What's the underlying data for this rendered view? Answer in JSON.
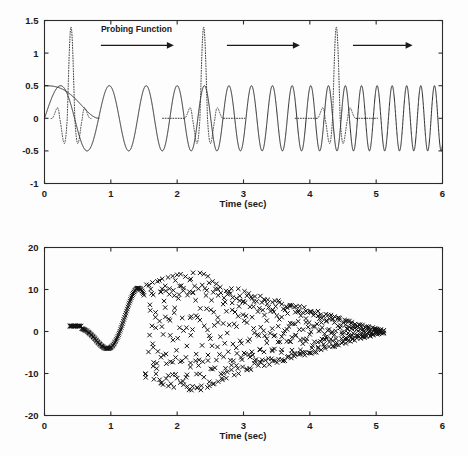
{
  "figure": {
    "name": "probing-function-chirp-figure",
    "panel_count": 2
  },
  "chart_data": [
    {
      "type": "line",
      "id": "top-panel",
      "title": "",
      "xlabel": "Time (sec)",
      "ylabel": "",
      "xlim": [
        0,
        6
      ],
      "ylim": [
        -1,
        1.5
      ],
      "xticks": [
        0,
        1,
        2,
        3,
        4,
        5,
        6
      ],
      "xtick_labels": [
        "0",
        "1",
        "2",
        "3",
        "4",
        "5",
        "6"
      ],
      "yticks": [
        -1,
        -0.5,
        0,
        0.5,
        1,
        1.5
      ],
      "ytick_labels": [
        "-1",
        "-0.5",
        "0",
        "0.5",
        "1",
        "1.5"
      ],
      "grid": false,
      "legend": "none",
      "annotations": [
        {
          "text": "Probing Function",
          "x": 0.85,
          "y": 1.32
        }
      ],
      "arrows": [
        {
          "x_start": 0.85,
          "x_end": 1.95,
          "y": 1.12
        },
        {
          "x_start": 2.75,
          "x_end": 3.85,
          "y": 1.12
        },
        {
          "x_start": 4.65,
          "x_end": 5.55,
          "y": 1.12
        }
      ],
      "series": [
        {
          "name": "chirp signal",
          "style": "solid",
          "amplitude": 0.5,
          "description": "Linear chirp, constant amplitude 0.5, frequency increasing from about 1 Hz at t=0 to about 5 Hz at t=6",
          "freq_start_hz": 0.95,
          "freq_end_hz": 5.0
        },
        {
          "name": "probing function envelope",
          "style": "solid",
          "description": "Decaying probe envelope starting at 0.5 at t=0, flattening to 0 by t approximately 0.8",
          "y_start": 0.5,
          "y_end": 0.0,
          "x_start": 0.0,
          "x_end": 0.82
        },
        {
          "name": "probe burst 1",
          "style": "dotted",
          "center_x": 0.4,
          "peak": 1.4,
          "trough": -0.65
        },
        {
          "name": "probe burst 2",
          "style": "dotted",
          "center_x": 2.4,
          "peak": 1.4,
          "trough": -0.65
        },
        {
          "name": "probe burst 3",
          "style": "dotted",
          "center_x": 4.4,
          "peak": 1.4,
          "trough": -0.65
        }
      ]
    },
    {
      "type": "scatter",
      "id": "bottom-panel",
      "title": "",
      "xlabel": "Time (sec)",
      "ylabel": "",
      "xlim": [
        0,
        6
      ],
      "ylim": [
        -20,
        20
      ],
      "xticks": [
        0,
        1,
        2,
        3,
        4,
        5,
        6
      ],
      "xtick_labels": [
        "0",
        "1",
        "2",
        "3",
        "4",
        "5",
        "6"
      ],
      "yticks": [
        -20,
        -10,
        0,
        10,
        20
      ],
      "ytick_labels": [
        "-20",
        "-10",
        "0",
        "10",
        "20"
      ],
      "grid": false,
      "legend": "none",
      "marker": "x",
      "series": [
        {
          "name": "correlation output",
          "style": "scatter-x",
          "description": "Dense x-markers tracing a smooth damped curve from t=0.4 to t=1.45, then dispersing into a widening scatter cloud peaking near plus or minus 14 around t=2.3 and decaying toward 0 by t=5.1",
          "x_start": 0.38,
          "x_end": 5.1,
          "envelope_peak": 14,
          "envelope_peak_x": 2.3,
          "dense_segment": [
            0.38,
            1.45
          ],
          "early_curve_points": [
            {
              "x": 0.4,
              "y": 1.3
            },
            {
              "x": 0.5,
              "y": 1.3
            },
            {
              "x": 0.6,
              "y": 1.1
            },
            {
              "x": 0.7,
              "y": 0.2
            },
            {
              "x": 0.8,
              "y": -2.2
            },
            {
              "x": 0.9,
              "y": -4.7
            },
            {
              "x": 1.0,
              "y": -4.4
            },
            {
              "x": 1.1,
              "y": -0.7
            },
            {
              "x": 1.2,
              "y": 6.6
            },
            {
              "x": 1.25,
              "y": 7.7
            },
            {
              "x": 1.32,
              "y": 6.3
            },
            {
              "x": 1.4,
              "y": 0.6
            },
            {
              "x": 1.48,
              "y": -9.6
            }
          ]
        }
      ]
    }
  ]
}
